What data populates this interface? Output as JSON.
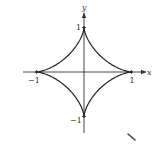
{
  "figure": {
    "type": "astroid",
    "equation": "x^(2/3) + y^(2/3) = 1",
    "axes": {
      "x_label": "x",
      "y_label": "y"
    },
    "ticks": {
      "x_pos": "1",
      "x_neg": "−1",
      "y_pos": "1",
      "y_neg": "−1"
    },
    "colors": {
      "curve": "#222222",
      "axis": "#333333",
      "background": "#ffffff"
    },
    "geometry": {
      "center_px": [
        84,
        72
      ],
      "rx_px": 47.5,
      "ry_px": 44.5
    }
  }
}
